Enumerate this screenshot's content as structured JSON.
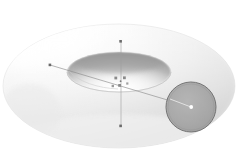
{
  "figure": {
    "title": "Torus with tube cross-section",
    "background_color": "#ffffff",
    "width": 238,
    "height": 165
  },
  "torus": {
    "name": "torus-surface",
    "description": "Shaded 3D torus (doughnut) seen from an elevated angle",
    "surface_color_light": "#ffffff",
    "surface_color_mid": "#f2f2f2",
    "surface_color_shadow": "#c9c9c9",
    "inner_hole_shadow": "#a8a8a8",
    "outline_color": "#d8d8d8",
    "outer_center": {
      "cx": 119,
      "cy": 86
    },
    "outer_rx": 116,
    "outer_ry": 62,
    "inner_rx": 52,
    "inner_ry": 20
  },
  "axes": {
    "vertical": {
      "name": "vertical-axis",
      "label": "",
      "color": "#9a9a9a",
      "x": 121,
      "y_top": 41,
      "y_bottom": 127,
      "tick_top": "▪",
      "tick_bottom": "▪"
    },
    "radial": {
      "name": "radial-axis",
      "label": "",
      "color": "#8d8d8d",
      "x1": 50,
      "y1": 65,
      "x2": 191,
      "y2": 107,
      "endpoint_marker": "▪"
    }
  },
  "cross_section": {
    "name": "tube-cross-section-disk",
    "fill_color": "#a3a3a3",
    "stroke_color": "#6b6b6b",
    "center": {
      "cx": 191,
      "cy": 107
    },
    "rx": 25,
    "ry": 25,
    "rotation_deg": -12,
    "center_dot_color": "#ffffff",
    "radius_line_color": "#e8e8e8"
  },
  "labels": {
    "origin_marks": [
      {
        "text": "▪",
        "x": 115,
        "y": 78
      },
      {
        "text": "▪",
        "x": 124,
        "y": 78
      },
      {
        "text": "▪",
        "x": 119,
        "y": 85
      },
      {
        "text": "▪",
        "x": 113,
        "y": 86
      }
    ],
    "axis_ticks": [
      {
        "text": "▪",
        "x": 119,
        "y": 41
      },
      {
        "text": "▪",
        "x": 119,
        "y": 125
      },
      {
        "text": "▪",
        "x": 49,
        "y": 64
      }
    ]
  }
}
